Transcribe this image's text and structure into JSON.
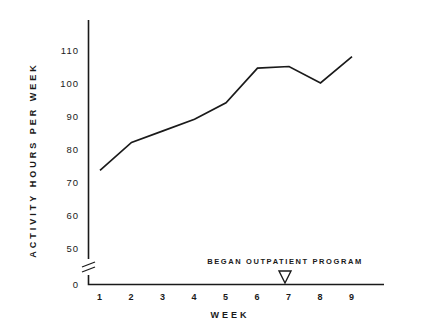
{
  "chart_data": {
    "type": "line",
    "title": "",
    "xlabel": "WEEK",
    "ylabel": "ACTIVITY HOURS PER WEEK",
    "categories": [
      1,
      2,
      3,
      4,
      5,
      6,
      7,
      8,
      9
    ],
    "x_tick_labels": [
      "1",
      "2",
      "3",
      "4",
      "5",
      "6",
      "7",
      "8",
      "9"
    ],
    "values": [
      73.5,
      82,
      85.5,
      89,
      94,
      104.5,
      105,
      100,
      108
    ],
    "series": [
      {
        "name": "Activity hours per week",
        "values": [
          73.5,
          82,
          85.5,
          89,
          94,
          104.5,
          105,
          100,
          108
        ]
      }
    ],
    "y_tick_labels": [
      "110",
      "100",
      "90",
      "80",
      "70",
      "60",
      "50",
      "0"
    ],
    "y_tick_values": [
      110,
      100,
      90,
      80,
      70,
      60,
      50,
      0
    ],
    "ylim": [
      50,
      115
    ],
    "xlim": [
      0.4,
      9.8
    ],
    "axis_break": true,
    "axis_break_note": "y-axis broken between 0 and 50",
    "grid": false,
    "legend": "none",
    "annotations": [
      {
        "text": "BEGAN  OUTPATIENT  PROGRAM",
        "marker": "triangle-down-open",
        "x": 6.85,
        "y": 0
      }
    ],
    "line_color": "#1a1a1a",
    "background_color": "#ffffff"
  },
  "axis": {
    "y_title": "ACTIVITY HOURS PER WEEK",
    "x_title": "WEEK"
  },
  "annotation": {
    "text": "BEGAN  OUTPATIENT  PROGRAM"
  }
}
